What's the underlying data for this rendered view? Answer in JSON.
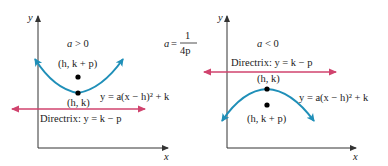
{
  "formula": {
    "lhs": "a",
    "eq": " = ",
    "num": "1",
    "den": "4p"
  },
  "left_panel": {
    "condition": "a > 0",
    "axis_y": "y",
    "axis_x": "x",
    "focus_label": "(h, k + p)",
    "vertex_label": "(h, k)",
    "equation": "y = a(x − h)² + k",
    "directrix": "Directrix: y = k − p"
  },
  "right_panel": {
    "condition": "a < 0",
    "axis_y": "y",
    "axis_x": "x",
    "focus_label": "(h, k + p)",
    "vertex_label": "(h, k)",
    "equation": "y = a(x − h)² + k",
    "directrix": "Directrix: y = k − p"
  },
  "colors": {
    "parabola": "#1f8fb8",
    "directrix": "#d0436e",
    "axis": "#333333",
    "point": "#000000"
  }
}
